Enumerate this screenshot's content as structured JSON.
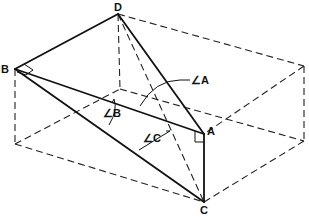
{
  "diagram": {
    "type": "geometry-box-tetrahedron",
    "vertices": [
      "A",
      "B",
      "C",
      "D"
    ],
    "vertex_labels": {
      "A": "A",
      "B": "B",
      "C": "C",
      "D": "D"
    },
    "angle_labels": {
      "A": "∠A",
      "B": "∠B",
      "C": "∠C"
    },
    "right_angles_at": [
      "B",
      "A"
    ],
    "solid_edges": [
      "B-D",
      "B-A",
      "B-C",
      "D-A",
      "A-C"
    ],
    "hidden_edges": [
      "D-C"
    ]
  }
}
